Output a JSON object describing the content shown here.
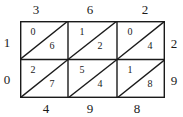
{
  "diagram": {
    "type": "lattice-multiplication",
    "multiplicand_digits": [
      "3",
      "6",
      "2"
    ],
    "multiplier_digits": [
      "2",
      "9"
    ],
    "left_carries": [
      "1",
      "0"
    ],
    "bottom_result_digits": [
      "4",
      "9",
      "8"
    ],
    "cells": [
      [
        {
          "tens": "0",
          "ones": "6"
        },
        {
          "tens": "1",
          "ones": "2"
        },
        {
          "tens": "0",
          "ones": "4"
        }
      ],
      [
        {
          "tens": "2",
          "ones": "7"
        },
        {
          "tens": "5",
          "ones": "4"
        },
        {
          "tens": "1",
          "ones": "8"
        }
      ]
    ],
    "line_color": "#1a1a1a"
  }
}
